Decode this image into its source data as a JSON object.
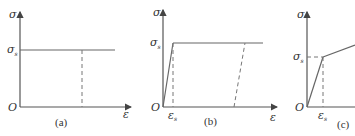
{
  "panels": [
    {
      "id": "a",
      "caption": "(a)",
      "y_axis_label": "σ",
      "yield_label": "σ",
      "yield_sub": "s",
      "origin_label": "O",
      "x_axis_label": "ε",
      "description": "Ideal rigid-plastic: horizontal line at yield stress, dashed unloading line vertical"
    },
    {
      "id": "b",
      "caption": "(b)",
      "y_axis_label": "σ",
      "yield_label": "σ",
      "yield_sub": "s",
      "origin_label": "O",
      "x_axis_label": "ε",
      "strain_label": "ε",
      "strain_sub": "s",
      "description": "Ideal elastic-plastic: linear elastic rise to yield, horizontal plateau, dashed parallel unloading line"
    },
    {
      "id": "c",
      "caption": "(c)",
      "y_axis_label": "σ",
      "yield_label": "σ",
      "yield_sub": "s",
      "origin_label": "O",
      "strain_label": "ε",
      "strain_sub": "s",
      "description": "Linear strain-hardening: linear elastic rise to yield, then linear hardening with smaller slope"
    }
  ],
  "colors": {
    "axis": "#555555",
    "curve": "#666666",
    "text": "#333333"
  }
}
